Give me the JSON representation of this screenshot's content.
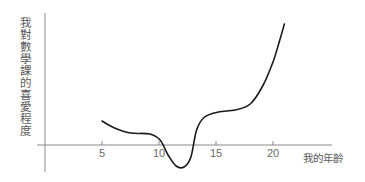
{
  "chart_data": {
    "type": "line",
    "title": "",
    "xlabel": "我的年齡",
    "ylabel": "我對數學課的喜愛程度",
    "x_ticks": [
      5,
      10,
      15,
      20
    ],
    "y_ticks": [],
    "xlim": [
      0,
      25.5
    ],
    "ylim": [
      -2.7,
      13.2
    ],
    "grid": false,
    "legend": null,
    "series": [
      {
        "name": "我對數學課的喜愛程度",
        "color": "#1a1a1a",
        "x": [
          5.0,
          6.1,
          7.5,
          9.2,
          10.1,
          10.8,
          11.5,
          12.2,
          12.8,
          13.3,
          14.0,
          15.2,
          16.7,
          18.0,
          19.1,
          20.0,
          20.6,
          21.0
        ],
        "y": [
          2.4,
          1.7,
          1.2,
          1.1,
          0.5,
          -1.0,
          -2.1,
          -2.2,
          -1.2,
          1.5,
          2.8,
          3.3,
          3.5,
          4.1,
          5.9,
          8.3,
          10.5,
          12.1
        ]
      }
    ],
    "annotations": []
  },
  "axes": {
    "x_tick_labels": [
      "5",
      "10",
      "15",
      "20"
    ]
  },
  "colors": {
    "axis": "#8a8a8a",
    "curve": "#1a1a1a",
    "label": "#5a5a5a"
  }
}
